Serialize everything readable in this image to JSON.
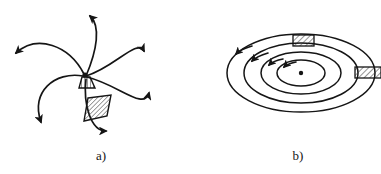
{
  "figure": {
    "background_color": "#ffffff",
    "ink_color": "#151515",
    "hatch_color": "#2a2a2a",
    "width": 381,
    "height": 174,
    "caption_font_style": "serif-italic-roman"
  },
  "panels": [
    {
      "id": "panel-a",
      "label": "a)",
      "label_x": 101,
      "label_y": 160,
      "description": "spiral-arm flow converging on a point with two hatched slab regions",
      "convergence_point": {
        "x": 85,
        "y": 75
      },
      "arc_count": 5,
      "arrow_count": 6,
      "hatched_regions": 2,
      "arcs": [
        {
          "name": "arc-top",
          "d": "M 86 76 C 96 52 100 28 88 16",
          "arrow_at": {
            "x": 88,
            "y": 16
          },
          "arrow_angle": 145
        },
        {
          "name": "arc-upper-right",
          "d": "M 86 76 C 112 66 136 40 144 52",
          "arrow_at": {
            "x": 144,
            "y": 53
          },
          "arrow_angle": 95
        },
        {
          "name": "arc-right",
          "d": "M 86 76 C 118 84 142 110 148 94",
          "arrow_at": {
            "x": 148,
            "y": 95
          },
          "arrow_angle": 250
        },
        {
          "name": "arc-left",
          "d": "M 84 74 C 70 46 38 36 16 53",
          "arrow_at": {
            "x": 15,
            "y": 53
          },
          "arrow_angle": 215
        },
        {
          "name": "arc-lower-left",
          "d": "M 84 76 C 56 72 32 92 42 122",
          "arrow_at": {
            "x": 42,
            "y": 123
          },
          "arrow_angle": 70
        },
        {
          "name": "arc-bottom",
          "d": "M 86 78 C 84 104 92 130 106 131",
          "arrow_at": {
            "x": 106,
            "y": 131
          },
          "arrow_angle": 0
        }
      ],
      "hatch_blocks": [
        {
          "name": "hatch-wedge-small",
          "points": "82,77 90,77 94,88 80,88",
          "hatch_spacing": 3,
          "hatch_angle": 0
        },
        {
          "name": "hatch-slab-large",
          "points": "86,98 110,96 106,117 84,120",
          "hatch_spacing": 4,
          "hatch_angle": 45
        }
      ]
    },
    {
      "id": "panel-b",
      "label": "b)",
      "label_x": 298,
      "label_y": 160,
      "description": "nested concentric ellipses in perspective with counterclockwise arrows, central dot and two hatched blocks",
      "center": {
        "x": 301,
        "y": 73
      },
      "center_dot_radius": 2,
      "ellipse_count": 4,
      "ellipses": [
        {
          "name": "ellipse-1-outer",
          "cx": 301,
          "cy": 73,
          "rx": 74,
          "ry": 39
        },
        {
          "name": "ellipse-2",
          "cx": 301,
          "cy": 73,
          "rx": 57,
          "ry": 30
        },
        {
          "name": "ellipse-3",
          "cx": 301,
          "cy": 73,
          "rx": 40,
          "ry": 21
        },
        {
          "name": "ellipse-4-inner",
          "cx": 301,
          "cy": 73,
          "rx": 24,
          "ry": 13
        }
      ],
      "arrows": [
        {
          "name": "arrow-ring-1",
          "x": 238,
          "y": 53,
          "angle": 210
        },
        {
          "name": "arrow-ring-2",
          "x": 255,
          "y": 58,
          "angle": 207
        },
        {
          "name": "arrow-ring-3",
          "x": 271,
          "y": 62,
          "angle": 203
        },
        {
          "name": "arrow-ring-4",
          "x": 285,
          "y": 65,
          "angle": 198
        }
      ],
      "hatch_blocks": [
        {
          "name": "hatch-block-top",
          "x": 293,
          "y": 35,
          "width": 21,
          "height": 11,
          "hatch_spacing": 3,
          "hatch_angle": 45
        },
        {
          "name": "hatch-block-right",
          "x": 355,
          "y": 67,
          "width": 26,
          "height": 11,
          "hatch_spacing": 3,
          "hatch_angle": 45
        }
      ]
    }
  ]
}
